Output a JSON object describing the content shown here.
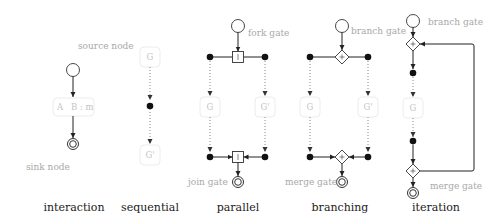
{
  "captions": {
    "interaction": "interaction",
    "sequential": "sequential",
    "parallel": "parallel",
    "branching": "branching",
    "iteration": "iteration"
  },
  "interaction": {
    "source_note": "source node",
    "sink_note": "sink node",
    "box_label_a": "A",
    "box_label_b": "B : m"
  },
  "sequential": {
    "top_box": "G",
    "bottom_box": "G'"
  },
  "parallel": {
    "fork_note": "fork gate",
    "join_note": "join gate",
    "left_box": "G",
    "right_box": "G'"
  },
  "branching": {
    "branch_note": "branch gate",
    "merge_note": "merge gate",
    "left_box": "G",
    "right_box": "G'"
  },
  "iteration": {
    "branch_note": "branch gate",
    "merge_note": "merge gate",
    "box": "G"
  },
  "colors": {
    "node_stroke": "#333333",
    "token_fill": "#111111",
    "note_text": "#a8a8a8",
    "box_border": "#ececec"
  }
}
